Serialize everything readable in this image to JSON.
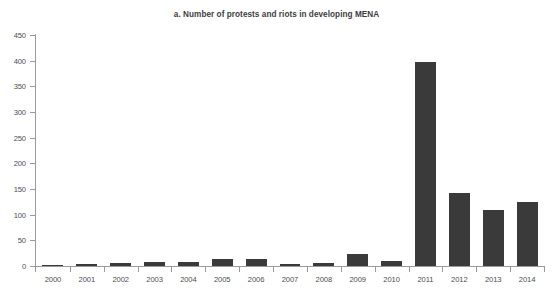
{
  "chart_data": {
    "type": "bar",
    "title": "a. Number of protests and riots in developing MENA",
    "xlabel": "",
    "ylabel": "",
    "categories": [
      "2000",
      "2001",
      "2002",
      "2003",
      "2004",
      "2005",
      "2006",
      "2007",
      "2008",
      "2009",
      "2010",
      "2011",
      "2012",
      "2013",
      "2014"
    ],
    "values": [
      1,
      4,
      6,
      8,
      7,
      13,
      13,
      3,
      5,
      23,
      9,
      397,
      142,
      110,
      125
    ],
    "series": [
      {
        "name": "Number of protests and riots",
        "values": [
          1,
          4,
          6,
          8,
          7,
          13,
          13,
          3,
          5,
          23,
          9,
          397,
          142,
          110,
          125
        ]
      }
    ],
    "ylim": [
      0,
      450
    ],
    "ytick_values": [
      0,
      50,
      100,
      150,
      200,
      250,
      300,
      350,
      400,
      450
    ],
    "ytick_labels": [
      "0",
      "50",
      "100",
      "150",
      "200",
      "250",
      "300",
      "350",
      "400",
      "450"
    ],
    "grid": false,
    "legend": false,
    "legend_position": "none",
    "bar_color": "#3a3a3a",
    "axis_color": "#9a9a9a",
    "background_color": "#ffffff"
  }
}
